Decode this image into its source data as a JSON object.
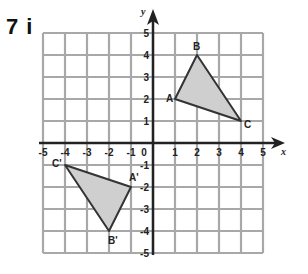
{
  "question": {
    "label": "7 i"
  },
  "graph": {
    "x_axis_label": "x",
    "y_axis_label": "y",
    "x_ticks": [
      "-5",
      "-4",
      "-3",
      "-2",
      "-1",
      "0",
      "1",
      "2",
      "3",
      "4",
      "5"
    ],
    "y_ticks": [
      "5",
      "4",
      "3",
      "2",
      "1",
      "-1",
      "-2",
      "-3",
      "-4",
      "-5"
    ],
    "range": {
      "xmin": -5,
      "xmax": 5,
      "ymin": -5,
      "ymax": 5
    },
    "colors": {
      "grid": "#a8a8a8",
      "axis": "#222222",
      "fill": "#cfcfcf",
      "edge": "#333333"
    }
  },
  "shapes": {
    "original": {
      "name": "Triangle ABC",
      "vertices": [
        {
          "label": "A",
          "x": 1,
          "y": 2
        },
        {
          "label": "B",
          "x": 2,
          "y": 4
        },
        {
          "label": "C",
          "x": 4,
          "y": 1
        }
      ]
    },
    "image": {
      "name": "Triangle A'B'C'",
      "vertices": [
        {
          "label": "A'",
          "x": -1,
          "y": -2
        },
        {
          "label": "B'",
          "x": -2,
          "y": -4
        },
        {
          "label": "C'",
          "x": -4,
          "y": -1
        }
      ]
    }
  }
}
